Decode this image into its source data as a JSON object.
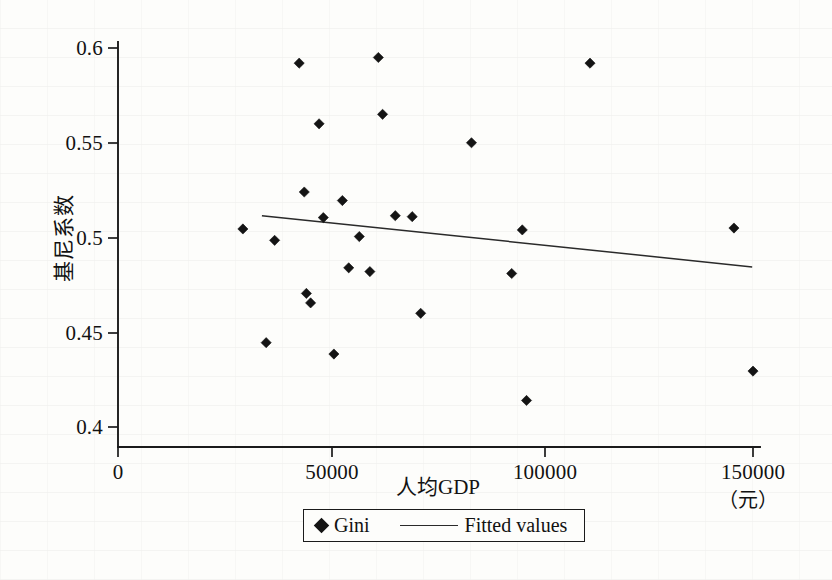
{
  "figure": {
    "background_color": "#fdfdfb",
    "ink_color": "#141414"
  },
  "axes": {
    "y_title": "基尼系数",
    "x_title": "人均GDP",
    "x_unit": "（元）",
    "x_ticks": [
      "0",
      "50000",
      "100000",
      "150000"
    ],
    "y_ticks": [
      "0.4",
      "0.45",
      "0.5",
      "0.55",
      "0.6"
    ]
  },
  "legend": {
    "scatter_label": "Gini",
    "fit_label": "Fitted values"
  },
  "chart_data": {
    "type": "scatter",
    "title": "",
    "xlabel": "人均GDP",
    "ylabel": "基尼系数",
    "x_unit": "（元）",
    "xlim": [
      0,
      158000
    ],
    "ylim": [
      0.4,
      0.605
    ],
    "xticks": [
      0,
      50000,
      100000,
      150000
    ],
    "yticks": [
      0.4,
      0.45,
      0.5,
      0.55,
      0.6
    ],
    "grid": false,
    "legend_position": "bottom-center",
    "series": [
      {
        "name": "Gini",
        "type": "scatter",
        "marker": "diamond",
        "color": "#141414",
        "points": [
          {
            "x": 29500,
            "y": 0.5045
          },
          {
            "x": 35000,
            "y": 0.4445
          },
          {
            "x": 37000,
            "y": 0.4985
          },
          {
            "x": 42800,
            "y": 0.592
          },
          {
            "x": 44000,
            "y": 0.524
          },
          {
            "x": 44500,
            "y": 0.4705
          },
          {
            "x": 45500,
            "y": 0.4655
          },
          {
            "x": 47500,
            "y": 0.56
          },
          {
            "x": 48500,
            "y": 0.5105
          },
          {
            "x": 51000,
            "y": 0.4385
          },
          {
            "x": 53000,
            "y": 0.5195
          },
          {
            "x": 54500,
            "y": 0.484
          },
          {
            "x": 57000,
            "y": 0.5005
          },
          {
            "x": 59500,
            "y": 0.482
          },
          {
            "x": 61500,
            "y": 0.595
          },
          {
            "x": 62500,
            "y": 0.565
          },
          {
            "x": 65500,
            "y": 0.5115
          },
          {
            "x": 69500,
            "y": 0.511
          },
          {
            "x": 71500,
            "y": 0.46
          },
          {
            "x": 83500,
            "y": 0.55
          },
          {
            "x": 93000,
            "y": 0.481
          },
          {
            "x": 95500,
            "y": 0.504
          },
          {
            "x": 96500,
            "y": 0.414
          },
          {
            "x": 111500,
            "y": 0.592
          },
          {
            "x": 145500,
            "y": 0.505
          },
          {
            "x": 150000,
            "y": 0.4295
          }
        ]
      },
      {
        "name": "Fitted values",
        "type": "line",
        "color": "#2a2a2a",
        "endpoints": [
          {
            "x": 34000,
            "y": 0.5115
          },
          {
            "x": 149800,
            "y": 0.4845
          }
        ]
      }
    ]
  }
}
